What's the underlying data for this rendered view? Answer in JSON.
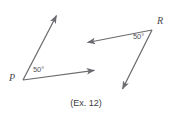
{
  "figure": {
    "caption": "(Ex. 12)",
    "stroke_color": "#6b6b70",
    "text_color": "#4a4a4f",
    "background_color": "#ffffff",
    "angles": [
      {
        "id": "angle-p",
        "vertex_label": "P",
        "measure_label": "50°",
        "vertex": {
          "x": 23,
          "y": 80
        },
        "rays": [
          {
            "id": "ray-p-up",
            "from": {
              "x": 23,
              "y": 80
            },
            "to": {
              "x": 58,
              "y": 13
            },
            "arrow": "to"
          },
          {
            "id": "ray-p-right",
            "from": {
              "x": 23,
              "y": 80
            },
            "to": {
              "x": 97,
              "y": 70
            },
            "arrow": "to"
          }
        ]
      },
      {
        "id": "angle-r",
        "vertex_label": "R",
        "measure_label": "50°",
        "vertex": {
          "x": 152,
          "y": 30
        },
        "rays": [
          {
            "id": "ray-r-left",
            "from": {
              "x": 152,
              "y": 30
            },
            "to": {
              "x": 85,
              "y": 43
            },
            "arrow": "to"
          },
          {
            "id": "ray-r-down",
            "from": {
              "x": 152,
              "y": 30
            },
            "to": {
              "x": 121,
              "y": 92
            },
            "arrow": "to"
          }
        ]
      }
    ],
    "labels": {
      "p_vertex": {
        "text": "P",
        "x": 9,
        "y": 73
      },
      "p_angle": {
        "text": "50°",
        "x": 33,
        "y": 66
      },
      "r_vertex": {
        "text": "R",
        "x": 157,
        "y": 16
      },
      "r_angle": {
        "text": "50°",
        "x": 133,
        "y": 33
      }
    }
  }
}
